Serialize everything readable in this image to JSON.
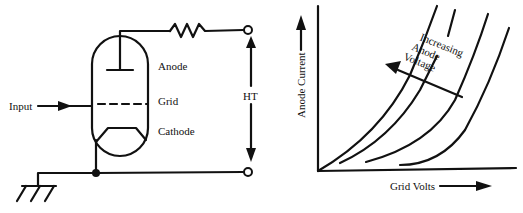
{
  "circuit": {
    "labels": {
      "input": "Input",
      "anode": "Anode",
      "grid": "Grid",
      "cathode": "Cathode",
      "ht": "HT"
    },
    "components": [
      "triode-valve",
      "anode-resistor",
      "ground",
      "ht-terminals"
    ]
  },
  "graph": {
    "y_axis_label": "Anode Current",
    "x_axis_label": "Grid Volts",
    "annotation": [
      "Increasing",
      "Anode",
      "Voltage"
    ],
    "curve_count": 4
  },
  "colors": {
    "ink": "#111111",
    "background": "#ffffff"
  }
}
